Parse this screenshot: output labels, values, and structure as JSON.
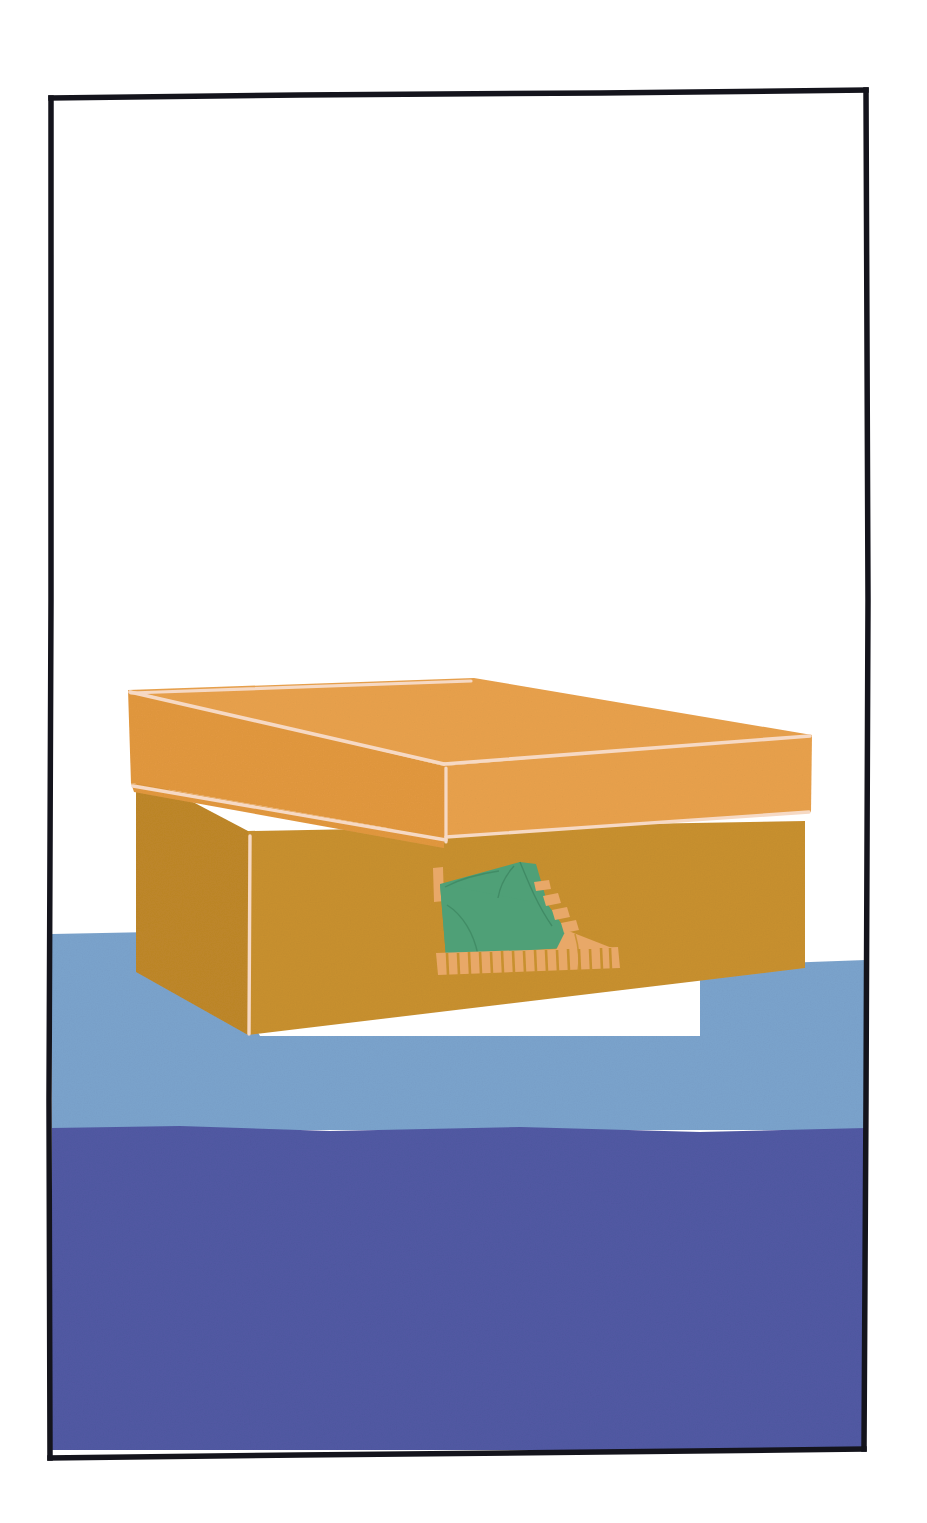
{
  "artwork": {
    "title": "Shoebox with sneaker graphic",
    "subject": "shoe-box",
    "medium": "flat-vector-illustration",
    "canvas": {
      "width": 927,
      "height": 1523
    }
  },
  "palette": {
    "paper_white": "#ffffff",
    "frame_black": "#14141c",
    "lid_orange": "#E8A14C",
    "box_body_ochre": "#C8902F",
    "edge_highlight": "#F6D9C4",
    "floor_light_blue": "#7BA3CC",
    "floor_dark_blue": "#5159A3",
    "shoe_green": "#4FA077",
    "shoe_trim_orange": "#E8A868"
  },
  "frame": {
    "name": "hand-drawn-black-border",
    "stroke_width": 5,
    "inset_left": 50,
    "inset_top": 96,
    "inset_right": 868,
    "inset_bottom": 1452
  },
  "scene": {
    "background_label": "white wall",
    "floor_bands": [
      {
        "name": "upper-floor-band",
        "color": "#7BA3CC",
        "top_y": 932,
        "bottom_y": 1128
      },
      {
        "name": "lower-floor-band",
        "color": "#5159A3",
        "top_y": 1128,
        "bottom_y": 1452
      }
    ]
  },
  "box": {
    "name": "shoe-box",
    "lid": {
      "label": "box lid",
      "top_face_color": "#E8A14C",
      "front_rim_color": "#E8A14C",
      "highlight_color": "#F6D9C4"
    },
    "body": {
      "label": "box body",
      "front_face_color": "#C8902F",
      "left_face_color": "#C8902F"
    }
  },
  "shoe_graphic": {
    "name": "sneaker-logo",
    "label": "green high-top sneaker",
    "upper_color": "#4FA077",
    "sole_color": "#E8A868",
    "lace_count": 4,
    "tread_stripe_count": 17,
    "toe_cap_color": "#E8A868"
  }
}
